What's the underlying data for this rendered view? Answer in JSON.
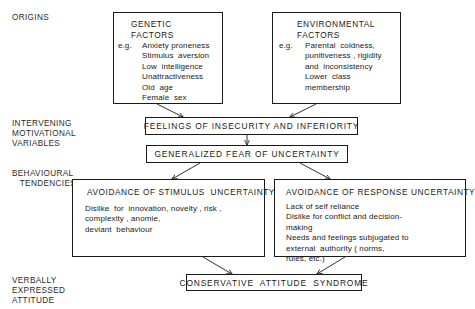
{
  "figure": {
    "type": "flow-diagram",
    "background": "#ffffff",
    "line_color": "#1a1a1a"
  },
  "stage_labels": [
    {
      "id": "origins",
      "text": "ORIGINS"
    },
    {
      "id": "intervening",
      "text": "INTERVENING\nMOTIVATIONAL\nVARIABLES"
    },
    {
      "id": "behavioural",
      "text": "BEHAVIOURAL\n   TENDENCIES"
    },
    {
      "id": "verbal",
      "text": "VERBALLY\nEXPRESSED\nATTITUDE"
    }
  ],
  "boxes": {
    "genetic": {
      "title": "GENETIC\nFACTORS",
      "eg": "e.g.",
      "items": "Anxiety proneness\nStimulus  aversion\nLow  intelligence\nUnattractiveness\nOld  age\nFemale  sex"
    },
    "environmental": {
      "title": "ENVIRONMENTAL\nFACTORS",
      "eg": "e.g.",
      "items": "Parental  coldness,\npunitiveness , rigidity\nand  inconsistency\nLower  class\nmembership"
    },
    "feelings": {
      "label": "FEELINGS OF INSECURITY AND INFERIORITY"
    },
    "generalized": {
      "label": "GENERALIZED FEAR OF UNCERTAINTY"
    },
    "stimulus": {
      "title": "AVOIDANCE OF STIMULUS  UNCERTAINTY",
      "body": "Dislike  for  innovation, novelty , risk ,\ncomplexity , anomie,\ndeviant  behaviour"
    },
    "response": {
      "title": "AVOIDANCE OF RESPONSE UNCERTAINTY",
      "body": "Lack of self reliance\nDislike for conflict and decision-\nmaking\nNeeds and feelings subjugated to\nexternal  authority ( norms,\nrules, etc.)"
    },
    "syndrome": {
      "label": "CONSERVATIVE  ATTITUDE  SYNDROME"
    }
  },
  "connectors": [
    {
      "id": "genetic-to-feelings",
      "from": "genetic",
      "to": "feelings"
    },
    {
      "id": "environmental-to-feelings",
      "from": "environmental",
      "to": "feelings"
    },
    {
      "id": "feelings-to-generalized",
      "from": "feelings",
      "to": "generalized"
    },
    {
      "id": "generalized-to-stimulus",
      "from": "generalized",
      "to": "stimulus"
    },
    {
      "id": "generalized-to-response",
      "from": "generalized",
      "to": "response"
    },
    {
      "id": "stimulus-to-syndrome",
      "from": "stimulus",
      "to": "syndrome"
    },
    {
      "id": "response-to-syndrome",
      "from": "response",
      "to": "syndrome"
    }
  ]
}
